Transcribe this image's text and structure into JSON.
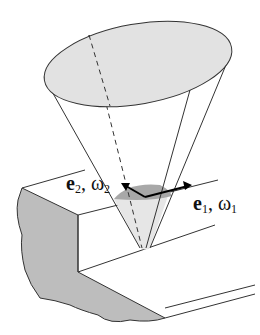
{
  "diagram": {
    "labels": {
      "e2": {
        "vec": "e",
        "sub": "2",
        "sep": ", ",
        "omega": "ω",
        "omega_sub": "2"
      },
      "e1": {
        "vec": "e",
        "sub": "1",
        "sep": ", ",
        "omega": "ω",
        "omega_sub": "1"
      }
    },
    "colors": {
      "ellipse_fill": "#e2e2e2",
      "cut_face_fill": "#bdbdbd",
      "cap_dark": "#a8a8a8",
      "cone_inner": "#e6e6e6",
      "stroke": "#333333"
    }
  }
}
